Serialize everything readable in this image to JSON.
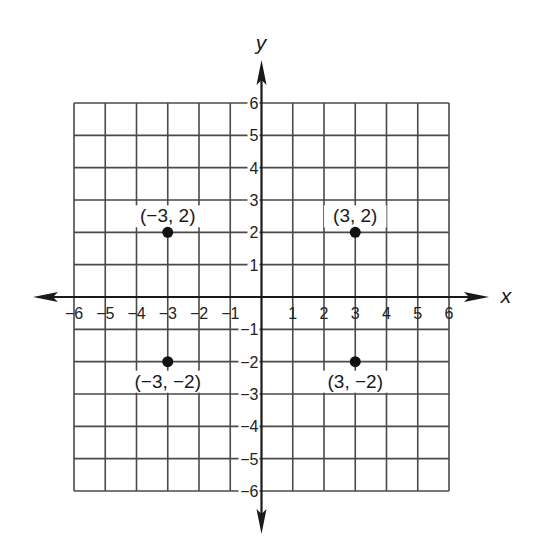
{
  "chart_data": {
    "type": "scatter",
    "title": "",
    "xlabel": "x",
    "ylabel": "y",
    "xlim": [
      -6,
      6
    ],
    "ylim": [
      -6,
      6
    ],
    "grid": true,
    "legend": null,
    "x_ticks": [
      -6,
      -5,
      -4,
      -3,
      -2,
      -1,
      1,
      2,
      3,
      4,
      5,
      6
    ],
    "y_ticks": [
      -6,
      -5,
      -4,
      -3,
      -2,
      -1,
      1,
      2,
      3,
      4,
      5,
      6
    ],
    "x_tick_labels": [
      "−6",
      "−5",
      "−4",
      "−3",
      "−2",
      "−1",
      "1",
      "2",
      "3",
      "4",
      "5",
      "6"
    ],
    "y_tick_labels": [
      "−6",
      "−5",
      "−4",
      "−3",
      "−2",
      "−1",
      "1",
      "2",
      "3",
      "4",
      "5",
      "6"
    ],
    "series": [
      {
        "name": "points",
        "points": [
          {
            "x": -3,
            "y": 2,
            "label": "(−3, 2)",
            "label_position": "above"
          },
          {
            "x": 3,
            "y": 2,
            "label": "(3, 2)",
            "label_position": "above"
          },
          {
            "x": -3,
            "y": -2,
            "label": "(−3, −2)",
            "label_position": "below"
          },
          {
            "x": 3,
            "y": -2,
            "label": "(3, −2)",
            "label_position": "below"
          }
        ]
      }
    ]
  },
  "colors": {
    "grid": "#4a4a4a",
    "axis": "#1a1a1a",
    "point": "#111111",
    "background": "#ffffff"
  }
}
